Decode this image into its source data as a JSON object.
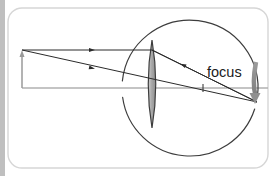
{
  "diagram": {
    "canvas": {
      "width": 275,
      "height": 176,
      "background": "#ffffff"
    },
    "frame": {
      "name": "rounded-panel-border",
      "x": 8,
      "y": 8,
      "width": 260,
      "height": 160,
      "radius": 14,
      "stroke": "#d6d6d6",
      "stroke_width": 1.4
    },
    "left_gutter_bar": {
      "name": "page-edge-bar",
      "x": 0,
      "y": 0,
      "width": 5,
      "height": 176,
      "color": "#bfbfbf"
    },
    "optical_axis": {
      "name": "optical-axis",
      "x1": 22,
      "y1": 88,
      "x2": 268,
      "y2": 88,
      "stroke": "#b0b0b0",
      "stroke_width": 1.3
    },
    "object_arrow": {
      "name": "object-arrow",
      "x": 22,
      "base_y": 88,
      "tip_y": 50,
      "stroke": "#9a9a9a",
      "stroke_width": 1.5,
      "head_width": 5,
      "head_length": 7,
      "direction": "up"
    },
    "lens": {
      "name": "converging-lens",
      "center_x": 152,
      "top_y": 40,
      "bottom_y": 128,
      "half_width": 7.5,
      "fill_light": "#d9d9d9",
      "fill_dark": "#9e9e9e",
      "stroke": "#3d3d3d",
      "stroke_width": 1.2,
      "type": "biconvex"
    },
    "eye_circle": {
      "name": "eyeball-circle",
      "center_x": 190,
      "center_y": 88,
      "radius": 68,
      "stroke": "#3d3d3d",
      "stroke_width": 1.2,
      "gap_top_degrees": 160,
      "gap_bottom_degrees": 200
    },
    "rays": [
      {
        "name": "ray-parallel-to-axis",
        "points": [
          [
            22,
            50
          ],
          [
            152,
            50
          ],
          [
            257,
            102
          ]
        ],
        "stroke": "#2b2b2b",
        "stroke_width": 1.0,
        "arrow_at": [
          92,
          50
        ],
        "arrow_direction": "right"
      },
      {
        "name": "ray-through-lens-center",
        "points": [
          [
            22,
            50
          ],
          [
            257,
            102
          ]
        ],
        "stroke": "#2b2b2b",
        "stroke_width": 1.0,
        "arrow_at": [
          92,
          68
        ],
        "arrow_direction": "right-down"
      },
      {
        "name": "ray-through-focus",
        "points": [
          [
            152,
            50
          ],
          [
            257,
            102
          ]
        ],
        "stroke": "#2b2b2b",
        "stroke_width": 1.0,
        "arrow_at": [
          183,
          65
        ],
        "arrow_direction": "left-up"
      }
    ],
    "focus_point": {
      "name": "focus-tick-mark",
      "x": 203,
      "y": 88,
      "tick_half_height": 4,
      "stroke": "#2b2b2b",
      "stroke_width": 1.0
    },
    "focus_label": {
      "name": "focus-label",
      "text": "focus",
      "x": 207,
      "y": 77,
      "font_size": 14.5,
      "color": "#1a1a1a"
    },
    "image_arrow": {
      "name": "image-arrow",
      "x": 257,
      "base_y": 62,
      "tip_y": 104,
      "stroke": "#8f8f8f",
      "stroke_width": 4.5,
      "head_width": 11,
      "head_length": 11,
      "direction": "down",
      "curve_control_x": 252
    }
  }
}
